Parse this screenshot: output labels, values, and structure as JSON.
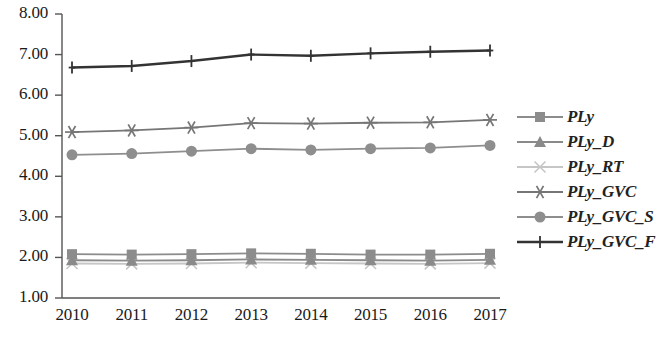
{
  "chart_data": {
    "type": "line",
    "title": "",
    "xlabel": "",
    "ylabel": "",
    "categories": [
      "2010",
      "2011",
      "2012",
      "2013",
      "2014",
      "2015",
      "2016",
      "2017"
    ],
    "x": [
      2010,
      2011,
      2012,
      2013,
      2014,
      2015,
      2016,
      2017
    ],
    "ylim": [
      1.0,
      8.0
    ],
    "ytick_labels": [
      "1.00",
      "2.00",
      "3.00",
      "4.00",
      "5.00",
      "6.00",
      "7.00",
      "8.00"
    ],
    "ytick_values": [
      1.0,
      2.0,
      3.0,
      4.0,
      5.0,
      6.0,
      7.0,
      8.0
    ],
    "grid": false,
    "legend_position": "right",
    "series": [
      {
        "name": "PLy",
        "marker": "square",
        "color": "#8c8c8c",
        "values": [
          2.08,
          2.07,
          2.08,
          2.1,
          2.09,
          2.07,
          2.07,
          2.09
        ]
      },
      {
        "name": "PLy_D",
        "marker": "triangle",
        "color": "#8a8a8a",
        "values": [
          1.93,
          1.92,
          1.93,
          1.95,
          1.94,
          1.93,
          1.92,
          1.94
        ]
      },
      {
        "name": "PLy_RT",
        "marker": "x",
        "color": "#c6c6c6",
        "values": [
          1.85,
          1.84,
          1.85,
          1.87,
          1.86,
          1.85,
          1.84,
          1.86
        ]
      },
      {
        "name": "PLy_GVC",
        "marker": "asterisk",
        "color": "#767676",
        "values": [
          5.09,
          5.13,
          5.2,
          5.31,
          5.3,
          5.32,
          5.33,
          5.39
        ]
      },
      {
        "name": "PLy_GVC_S",
        "marker": "circle",
        "color": "#8e8e8e",
        "values": [
          4.53,
          4.56,
          4.62,
          4.68,
          4.65,
          4.68,
          4.7,
          4.76
        ]
      },
      {
        "name": "PLy_GVC_F",
        "marker": "plus",
        "color": "#333333",
        "values": [
          6.68,
          6.72,
          6.84,
          7.0,
          6.97,
          7.03,
          7.07,
          7.1
        ]
      }
    ]
  },
  "axis": {
    "line_color": "#555555"
  }
}
